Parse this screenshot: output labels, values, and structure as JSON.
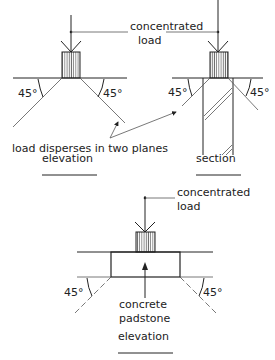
{
  "diagram": {
    "colors": {
      "ink": "#222222",
      "background": "#ffffff"
    },
    "top_left": {
      "view_label": "elevation",
      "load_label_line1": "concentrated",
      "load_label_line2": "load",
      "angle_left": "45°",
      "angle_right": "45°"
    },
    "top_right": {
      "view_label": "section",
      "angle_left": "45°",
      "angle_right": "45°"
    },
    "note": "load disperses in two planes",
    "bottom": {
      "view_label": "elevation",
      "load_label_line1": "concentrated",
      "load_label_line2": "load",
      "padstone_label_line1": "concrete",
      "padstone_label_line2": "padstone",
      "angle_left": "45°",
      "angle_right": "45°"
    }
  }
}
